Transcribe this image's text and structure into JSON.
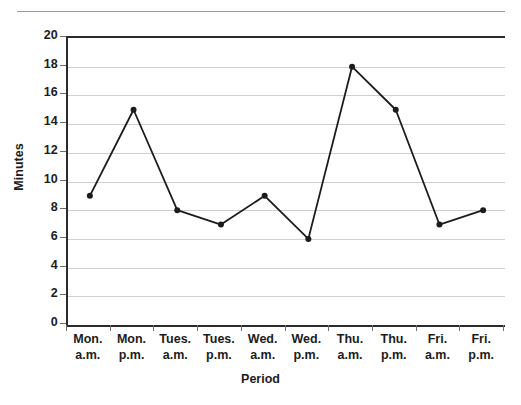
{
  "chart_data": {
    "type": "line",
    "title": "",
    "xlabel": "Period",
    "ylabel": "Minutes",
    "categories": [
      "Mon. a.m.",
      "Mon. p.m.",
      "Tues. a.m.",
      "Tues. p.m.",
      "Wed. a.m.",
      "Wed. p.m.",
      "Thu. a.m.",
      "Thu. p.m.",
      "Fri. a.m.",
      "Fri. p.m."
    ],
    "category_lines": [
      [
        "Mon.",
        "a.m."
      ],
      [
        "Mon.",
        "p.m."
      ],
      [
        "Tues.",
        "a.m."
      ],
      [
        "Tues.",
        "p.m."
      ],
      [
        "Wed.",
        "a.m."
      ],
      [
        "Wed.",
        "p.m."
      ],
      [
        "Thu.",
        "a.m."
      ],
      [
        "Thu.",
        "p.m."
      ],
      [
        "Fri.",
        "a.m."
      ],
      [
        "Fri.",
        "p.m."
      ]
    ],
    "values": [
      9,
      15,
      8,
      7,
      9,
      6,
      18,
      15,
      7,
      8
    ],
    "ylim": [
      0,
      20
    ],
    "ytick_values": [
      0,
      2,
      4,
      6,
      8,
      10,
      12,
      14,
      16,
      18,
      20
    ],
    "ytick_labels": [
      "0",
      "2",
      "4",
      "6",
      "8",
      "10",
      "12",
      "14",
      "16",
      "18",
      "20"
    ],
    "grid": true,
    "grid_axis": "y",
    "legend": false,
    "legend_position": "none",
    "marker": "circle",
    "series": [
      {
        "name": "Minutes",
        "values": [
          9,
          15,
          8,
          7,
          9,
          6,
          18,
          15,
          7,
          8
        ]
      }
    ]
  },
  "style": {
    "line_color": "#1c1c1c",
    "marker_color": "#1c1c1c",
    "grid_color": "#cfcfcf",
    "axis_color": "#2b2b2b",
    "tick_color": "#6e6e6e",
    "text_color": "#1c1c1c",
    "background": "#ffffff"
  }
}
